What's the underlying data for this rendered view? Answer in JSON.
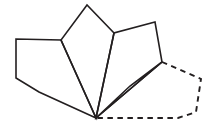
{
  "figure": {
    "background_color": "#ffffff",
    "stroke_color": "#231f20",
    "width": 211,
    "height": 128,
    "shared_vertex": {
      "label": "center-bottom-vertex",
      "x": 96,
      "y": 118
    }
  },
  "shapes": [
    {
      "name": "pentagon-left",
      "style": "solid",
      "stroke": "#231f20",
      "stroke_width": 1.6,
      "points": "96,118 16,39 16,78 39,92",
      "path": "M 96,118 L 39,92 L 16,78 L 16,39 L 61,40 Z",
      "vertices": [
        {
          "x": 96,
          "y": 118
        },
        {
          "x": 39,
          "y": 92
        },
        {
          "x": 16,
          "y": 78
        },
        {
          "x": 16,
          "y": 39
        },
        {
          "x": 61,
          "y": 40
        }
      ]
    },
    {
      "name": "pentagon-upper-left",
      "style": "solid",
      "stroke": "#231f20",
      "stroke_width": 1.6,
      "path": "M 96,118 L 61,40 L 87,5 L 114,33 Z",
      "vertices": [
        {
          "x": 96,
          "y": 118
        },
        {
          "x": 61,
          "y": 40
        },
        {
          "x": 87,
          "y": 5
        },
        {
          "x": 114,
          "y": 33
        }
      ]
    },
    {
      "name": "pentagon-upper-right",
      "style": "solid",
      "stroke": "#231f20",
      "stroke_width": 1.6,
      "path": "M 96,118 L 114,33 L 155,22 L 162,62 Z",
      "vertices": [
        {
          "x": 96,
          "y": 118
        },
        {
          "x": 114,
          "y": 33
        },
        {
          "x": 155,
          "y": 22
        },
        {
          "x": 162,
          "y": 62
        }
      ]
    },
    {
      "name": "pentagon-right",
      "style": "solid",
      "stroke": "#231f20",
      "stroke_width": 1.6,
      "path": "M 96,118 L 162,62 L 130,86 Z",
      "vertices": [
        {
          "x": 96,
          "y": 118
        },
        {
          "x": 162,
          "y": 62
        },
        {
          "x": 130,
          "y": 86
        }
      ]
    },
    {
      "name": "pentagon-gap-dashed",
      "style": "dashed",
      "stroke": "#231f20",
      "stroke_width": 1.9,
      "dash_pattern": "5.5 4.5",
      "path": "M 162,62 L 201,79 L 196,112 L 178,118 L 96,118",
      "vertices": [
        {
          "x": 162,
          "y": 62
        },
        {
          "x": 201,
          "y": 79
        },
        {
          "x": 196,
          "y": 112
        },
        {
          "x": 178,
          "y": 118
        },
        {
          "x": 96,
          "y": 118
        }
      ]
    }
  ]
}
